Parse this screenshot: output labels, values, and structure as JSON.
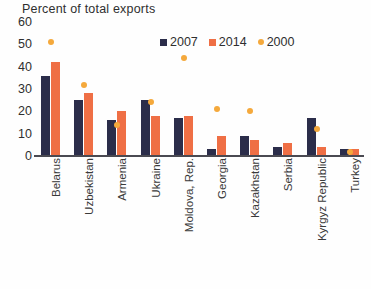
{
  "chart_data": {
    "type": "bar",
    "title": "Percent of total exports",
    "xlabel": "",
    "ylabel": "",
    "ylim": [
      0,
      60
    ],
    "yticks": [
      60,
      50,
      40,
      30,
      20,
      10,
      0
    ],
    "grid": false,
    "legend_position": "top-right",
    "categories": [
      "Belarus",
      "Uzbekistan",
      "Armenia",
      "Ukraine",
      "Moldova, Rep.",
      "Georgia",
      "Kazakhstan",
      "Serbia",
      "Kyrgyz Republic",
      "Turkey"
    ],
    "series": [
      {
        "name": "2007",
        "type": "bar",
        "color": "#2b2d4a",
        "values": [
          36,
          25,
          16,
          25,
          17,
          3,
          9,
          4,
          17,
          3
        ]
      },
      {
        "name": "2014",
        "type": "bar",
        "color": "#ef6f45",
        "values": [
          42,
          28,
          20,
          18,
          18,
          9,
          7,
          6,
          4,
          3
        ]
      },
      {
        "name": "2000",
        "type": "scatter",
        "color": "#f5a93c",
        "values": [
          51,
          32,
          14,
          24,
          44,
          21,
          20,
          null,
          12,
          2
        ]
      }
    ]
  },
  "colors": {
    "series_2007": "#2b2d4a",
    "series_2014": "#ef6f45",
    "series_2000": "#f5a93c",
    "axis": "#4a4a52",
    "text": "#2f2f2f",
    "background": "#fefefe"
  }
}
